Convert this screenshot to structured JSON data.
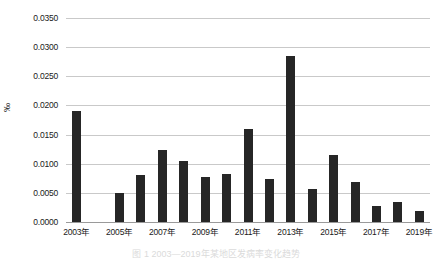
{
  "chart_data": {
    "type": "bar",
    "title": "",
    "xlabel": "",
    "ylabel": "‰",
    "ylim": [
      0,
      0.035
    ],
    "ytick_step": 0.005,
    "grid": true,
    "legend": null,
    "bar_color": "#262626",
    "gridline_color": "#c9c9c9",
    "categories": [
      "2003年",
      "2004年",
      "2005年",
      "2006年",
      "2007年",
      "2008年",
      "2009年",
      "2010年",
      "2011年",
      "2012年",
      "2013年",
      "2014年",
      "2015年",
      "2016年",
      "2017年",
      "2018年",
      "2019年"
    ],
    "tick_labels": [
      "2003年",
      "2005年",
      "2007年",
      "2009年",
      "2011年",
      "2013年",
      "2015年",
      "2017年",
      "2019年"
    ],
    "values": [
      0.019,
      0.0,
      0.005,
      0.008,
      0.0123,
      0.0105,
      0.0078,
      0.0082,
      0.0159,
      0.0073,
      0.0285,
      0.0056,
      0.0115,
      0.0069,
      0.0028,
      0.0034,
      0.0019
    ],
    "ytick_labels": [
      "0.0000",
      "0.0050",
      "0.0100",
      "0.0150",
      "0.0200",
      "0.0250",
      "0.0300",
      "0.0350"
    ],
    "ytick_values": [
      0.0,
      0.005,
      0.01,
      0.015,
      0.02,
      0.025,
      0.03,
      0.035
    ]
  },
  "caption": {
    "text": "图 1 2003—2019年某地区发病率变化趋势"
  }
}
